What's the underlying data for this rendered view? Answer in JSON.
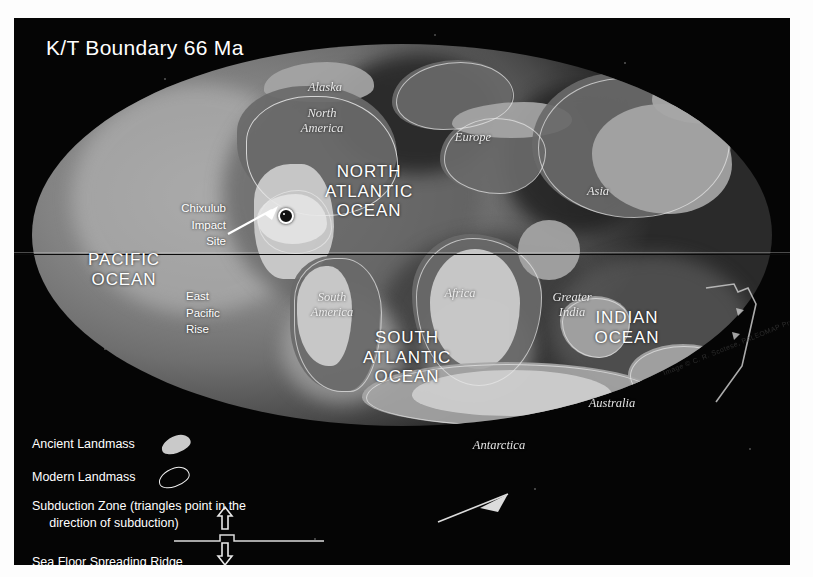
{
  "title": "K/T Boundary 66 Ma",
  "map": {
    "oceans": [
      {
        "name": "pacific-ocean",
        "label": "PACIFIC\nOCEAN"
      },
      {
        "name": "north-atlantic-ocean",
        "label": "NORTH\nATLANTIC\nOCEAN"
      },
      {
        "name": "south-atlantic-ocean",
        "label": "SOUTH\nATLANTIC\nOCEAN"
      },
      {
        "name": "indian-ocean",
        "label": "INDIAN\nOCEAN"
      }
    ],
    "continents": [
      {
        "name": "alaska",
        "label": "Alaska"
      },
      {
        "name": "north-america",
        "label": "North\nAmerica"
      },
      {
        "name": "europe",
        "label": "Europe"
      },
      {
        "name": "asia",
        "label": "Asia"
      },
      {
        "name": "south-america",
        "label": "South\nAmerica"
      },
      {
        "name": "africa",
        "label": "Africa"
      },
      {
        "name": "greater-india",
        "label": "Greater\nIndia"
      },
      {
        "name": "australia",
        "label": "Australia"
      },
      {
        "name": "antarctica",
        "label": "Antarctica"
      }
    ],
    "features": [
      {
        "name": "chixulub-impact-site",
        "label": "Chixulub\nImpact\nSite"
      },
      {
        "name": "east-pacific-rise",
        "label": "East\nPacific\nRise"
      }
    ],
    "credit": "Image © C. R. Scotese, PALEOMAP Project"
  },
  "legend": {
    "ancient_landmass": "Ancient Landmass",
    "modern_landmass": "Modern Landmass",
    "subduction_zone": "Subduction Zone (triangles point in the\n     direction of subduction)",
    "spreading_ridge": "Sea Floor Spreading Ridge"
  },
  "colors": {
    "background": "#050505",
    "text": "#ffffff",
    "land_bright": "#cfcfcf",
    "ocean_mid": "#6f6f6f",
    "equator": "#0b0b0b"
  }
}
